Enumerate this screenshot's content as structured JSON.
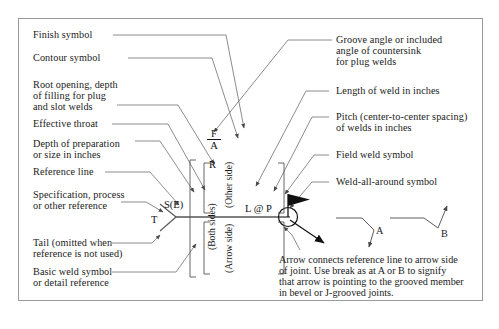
{
  "diagram": {
    "frame_color": "#9a9a9a",
    "line_color": "#6f6f6f",
    "text_color": "#1a1a1a"
  },
  "left_labels": [
    {
      "id": "finish-symbol",
      "text": "Finish symbol"
    },
    {
      "id": "contour-symbol",
      "text": "Contour symbol"
    },
    {
      "id": "root-opening",
      "line1": "Root opening, depth",
      "line2": "of filling for plug",
      "line3": "and slot welds"
    },
    {
      "id": "effective-throat",
      "text": "Effective throat"
    },
    {
      "id": "depth-of-preparation",
      "line1": "Depth of preparation",
      "line2": "or size in inches"
    },
    {
      "id": "reference-line",
      "text": "Reference line"
    },
    {
      "id": "specification-process",
      "line1": "Specification, process",
      "line2": "or other reference"
    },
    {
      "id": "tail",
      "line1": "Tail (omitted when",
      "line2": "reference is not used)"
    },
    {
      "id": "basic-weld-symbol",
      "line1": "Basic weld symbol",
      "line2": "or detail reference"
    }
  ],
  "right_labels": [
    {
      "id": "groove-angle",
      "line1": "Groove angle or included",
      "line2": "angle of countersink",
      "line3": "for plug welds"
    },
    {
      "id": "length-of-weld",
      "text": "Length of weld in inches"
    },
    {
      "id": "pitch",
      "line1": "Pitch (center-to-center spacing)",
      "line2": "of welds in inches"
    },
    {
      "id": "field-weld-symbol",
      "text": "Field weld symbol"
    },
    {
      "id": "weld-all-around-symbol",
      "text": "Weld-all-around symbol"
    }
  ],
  "symbols": {
    "finish": "F",
    "contour": "A",
    "root_opening": "R",
    "size_effective_throat": "S(E)",
    "tail_text": "T",
    "length_pitch": "L @ P",
    "break_a": "A",
    "break_b": "B"
  },
  "side_brackets": {
    "other_side": "(Other side)",
    "arrow_side": "(Arrow side)",
    "both_sides": "(Both sides)"
  },
  "bottom_note": {
    "line1": "Arrow connects reference line to arrow side",
    "line2": "of joint. Use break as at A or B to signify",
    "line3": "that arrow is pointing to the grooved member",
    "line4": "in bevel or J-grooved joints."
  }
}
